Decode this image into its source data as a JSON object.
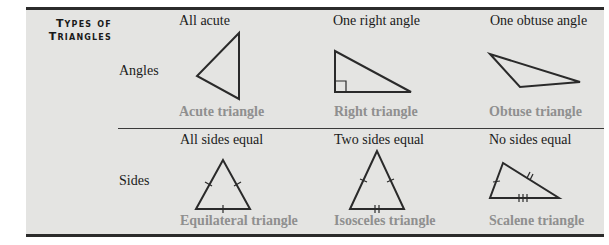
{
  "title": {
    "line1": "Types of",
    "line2": "Triangles"
  },
  "rows": [
    {
      "label": "Angles",
      "columns": [
        {
          "heading": "All acute",
          "caption": "Acute triangle",
          "icon": "acute-triangle-icon"
        },
        {
          "heading": "One right angle",
          "caption": "Right triangle",
          "icon": "right-triangle-icon"
        },
        {
          "heading": "One obtuse angle",
          "caption": "Obtuse triangle",
          "icon": "obtuse-triangle-icon"
        }
      ]
    },
    {
      "label": "Sides",
      "columns": [
        {
          "heading": "All sides equal",
          "caption": "Equilateral triangle",
          "icon": "equilateral-triangle-icon"
        },
        {
          "heading": "Two sides equal",
          "caption": "Isosceles triangle",
          "icon": "isosceles-triangle-icon"
        },
        {
          "heading": "No sides equal",
          "caption": "Scalene triangle",
          "icon": "scalene-triangle-icon"
        }
      ]
    }
  ],
  "colors": {
    "background": "#e4e4e2",
    "rule": "#2b2b2b",
    "caption": "#8f8f8f",
    "text": "#1a1a1a"
  }
}
